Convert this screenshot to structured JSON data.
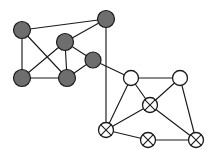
{
  "figure": {
    "name": "undirected-graph-two-clusters",
    "width": 216,
    "height": 155,
    "background_color": "#ffffff"
  },
  "style": {
    "edge_color": "#1b1b1b",
    "edge_width": 1.15,
    "gray_fill": "#6e6e6e",
    "white_fill": "#ffffff",
    "outline_color": "#1b1b1b",
    "gray_radius": 8.5,
    "white_radius": 7.5,
    "crossed_radius": 7.5
  },
  "chart_data": {
    "type": "diagram",
    "title": "",
    "xlabel": "",
    "ylabel": "",
    "legend": [
      {
        "key": "gray",
        "label": "filled gray vertex",
        "fill": "#6e6e6e"
      },
      {
        "key": "white",
        "label": "open white vertex",
        "fill": "#ffffff"
      },
      {
        "key": "crossed",
        "label": "crossed vertex",
        "fill": "#ffffff"
      }
    ],
    "nodes": [
      {
        "id": "g1",
        "label": "",
        "x": 22,
        "y": 30,
        "kind": "gray",
        "radius": 8.5
      },
      {
        "id": "g2",
        "label": "",
        "x": 106,
        "y": 19,
        "kind": "gray",
        "radius": 8.5
      },
      {
        "id": "g3",
        "label": "",
        "x": 65,
        "y": 42,
        "kind": "gray",
        "radius": 8.5
      },
      {
        "id": "g4",
        "label": "",
        "x": 93,
        "y": 60,
        "kind": "gray",
        "radius": 8.0
      },
      {
        "id": "g5",
        "label": "",
        "x": 22,
        "y": 78,
        "kind": "gray",
        "radius": 8.5
      },
      {
        "id": "g6",
        "label": "",
        "x": 67,
        "y": 78,
        "kind": "gray",
        "radius": 8.5
      },
      {
        "id": "w1",
        "label": "",
        "x": 131,
        "y": 78,
        "kind": "white",
        "radius": 7.5
      },
      {
        "id": "w2",
        "label": "",
        "x": 180,
        "y": 78,
        "kind": "white",
        "radius": 7.5
      },
      {
        "id": "c1",
        "label": "",
        "x": 150,
        "y": 105,
        "kind": "crossed",
        "radius": 7.5
      },
      {
        "id": "c2",
        "label": "",
        "x": 106,
        "y": 130,
        "kind": "crossed",
        "radius": 7.5
      },
      {
        "id": "c3",
        "label": "",
        "x": 148,
        "y": 140,
        "kind": "crossed",
        "radius": 7.5
      },
      {
        "id": "c4",
        "label": "",
        "x": 196,
        "y": 140,
        "kind": "crossed",
        "radius": 7.5
      }
    ],
    "edges": [
      {
        "from": "g1",
        "to": "g2"
      },
      {
        "from": "g1",
        "to": "g5"
      },
      {
        "from": "g1",
        "to": "g6"
      },
      {
        "from": "g2",
        "to": "g3"
      },
      {
        "from": "g2",
        "to": "c2"
      },
      {
        "from": "g3",
        "to": "g5"
      },
      {
        "from": "g3",
        "to": "g6"
      },
      {
        "from": "g3",
        "to": "g4"
      },
      {
        "from": "g4",
        "to": "g6"
      },
      {
        "from": "g4",
        "to": "w1"
      },
      {
        "from": "g5",
        "to": "g6"
      },
      {
        "from": "w1",
        "to": "w2"
      },
      {
        "from": "w1",
        "to": "c1"
      },
      {
        "from": "w1",
        "to": "c2"
      },
      {
        "from": "w2",
        "to": "c1"
      },
      {
        "from": "w2",
        "to": "c4"
      },
      {
        "from": "c1",
        "to": "c2"
      },
      {
        "from": "c1",
        "to": "c4"
      },
      {
        "from": "c2",
        "to": "c3"
      },
      {
        "from": "c3",
        "to": "c4"
      }
    ]
  }
}
